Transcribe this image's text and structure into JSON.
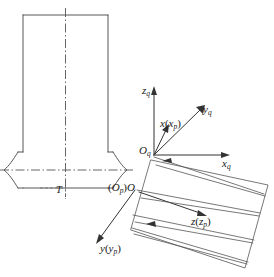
{
  "figure": {
    "width": 274,
    "height": 277,
    "background_color": "#ffffff",
    "line_color": "#444444",
    "axis_color": "#333333",
    "centerline_color": "#555555"
  },
  "workpiece": {
    "name": "cylindrical-workpiece-cross-section",
    "description": "Vertical cylindrical body with a necked groove section at the bottom",
    "dimension_label": "T",
    "has_vertical_centerline": true,
    "has_horizontal_centerline": true
  },
  "coordinate_systems": {
    "tool_frame": {
      "origin_label_main": "O",
      "origin_label_sub": "q",
      "axes": [
        {
          "name": "z-axis-q",
          "label_main": "z",
          "label_sub": "q",
          "direction": "up"
        },
        {
          "name": "x-axis-q",
          "label_main": "x",
          "label_sub": "q",
          "direction": "right"
        },
        {
          "name": "y-axis-q",
          "label_main": "y",
          "label_sub": "q",
          "direction": "upper-right-diagonal"
        }
      ]
    },
    "workpiece_frame": {
      "origin_label_paren_open": "(",
      "origin_label_sub_main": "O",
      "origin_label_sub": "p",
      "origin_label_paren_close": ")",
      "origin_label_main": "O",
      "axes": [
        {
          "name": "x-axis-p",
          "label_main": "x",
          "label_paren_open": "(",
          "label_inner_main": "x",
          "label_inner_sub": "p",
          "label_paren_close": ")",
          "direction": "up-slightly-right"
        },
        {
          "name": "y-axis-p",
          "label_main": "y",
          "label_paren_open": "(",
          "label_inner_main": "y",
          "label_inner_sub": "p",
          "label_paren_close": ")",
          "direction": "lower-left"
        },
        {
          "name": "z-axis-p",
          "label_main": "z",
          "label_paren_open": "(",
          "label_inner_main": "z",
          "label_inner_sub": "p",
          "label_paren_close": ")",
          "direction": "lower-right"
        }
      ]
    }
  },
  "surface_patch": {
    "name": "tilted-machined-surface",
    "description": "Rotated quadrilateral patch with four pairs of converging tool-path lines",
    "path_line_count": 4
  }
}
